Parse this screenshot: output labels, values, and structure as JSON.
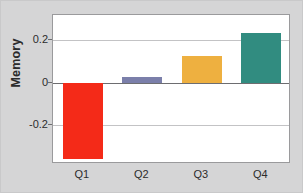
{
  "chart_data": {
    "type": "bar",
    "title": "",
    "xlabel": "",
    "ylabel": "Memory",
    "categories": [
      "Q1",
      "Q2",
      "Q3",
      "Q4"
    ],
    "values": [
      -0.357,
      0.024,
      0.124,
      0.233
    ],
    "series": [
      {
        "name": "Memory",
        "values": [
          -0.357,
          0.024,
          0.124,
          0.233
        ]
      }
    ],
    "bar_colors": [
      "#f42a18",
      "#7b7faa",
      "#eeb040",
      "#318c80"
    ],
    "ylim": [
      -0.38,
      0.315
    ],
    "yticks": [
      0.2,
      0,
      -0.2
    ],
    "ytick_labels": [
      "0.2",
      "0",
      "-0.2"
    ],
    "grid": true,
    "grid_axis": "y",
    "zero_line": true,
    "legend": false,
    "legend_position": "none",
    "background_color": "#d5d5d6",
    "plot_background_color": "#ffffff",
    "frame_color": "#9a9a9c",
    "gridline_color": "#c3c3c5",
    "zeroline_color": "#6d6d70"
  },
  "axes": {
    "y_title": "Memory",
    "y_ticks": [
      {
        "label": "0.2",
        "value": 0.2
      },
      {
        "label": "0",
        "value": 0
      },
      {
        "label": "-0.2",
        "value": -0.2
      }
    ],
    "x_ticks": [
      {
        "label": "Q1"
      },
      {
        "label": "Q2"
      },
      {
        "label": "Q3"
      },
      {
        "label": "Q4"
      }
    ]
  }
}
